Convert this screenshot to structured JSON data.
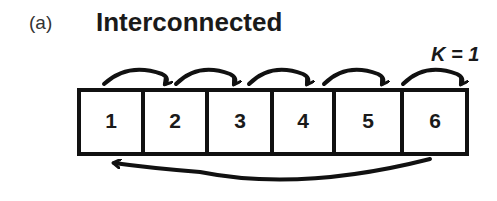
{
  "panel_label": "(a)",
  "title": "Interconnected",
  "k_label": "K = 1",
  "cells": [
    {
      "label": "1"
    },
    {
      "label": "2"
    },
    {
      "label": "3"
    },
    {
      "label": "4"
    },
    {
      "label": "5"
    },
    {
      "label": "6"
    }
  ],
  "arrows": {
    "forward": [
      {
        "from": "1",
        "to": "2"
      },
      {
        "from": "2",
        "to": "3"
      },
      {
        "from": "3",
        "to": "4"
      },
      {
        "from": "4",
        "to": "5"
      },
      {
        "from": "5",
        "to": "6"
      },
      {
        "from": "6",
        "to": "next"
      }
    ],
    "wrap": {
      "from": "6",
      "to": "1"
    }
  },
  "colors": {
    "stroke": "#111111",
    "background": "#ffffff"
  }
}
